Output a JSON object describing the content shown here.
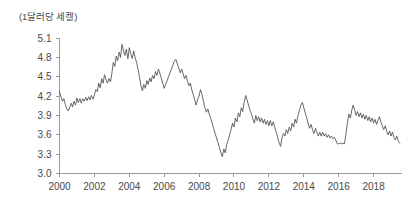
{
  "figure": {
    "unit_label": "(1달러당 세켈)",
    "background_color": "#ffffff",
    "line_color": "#4d4d4d",
    "axis_color": "#9a9a9a",
    "text_color": "#4a4a4a"
  },
  "chart_data": {
    "type": "line",
    "title": "",
    "subtitle": "",
    "xlabel": "",
    "ylabel": "(1달러당 세켈)",
    "unit": "1달러당 세켈",
    "grid": false,
    "legend": "none",
    "xlim": [
      2000.0,
      2019.6
    ],
    "ylim": [
      3.0,
      5.1
    ],
    "xticks": [
      2000,
      2002,
      2004,
      2006,
      2008,
      2010,
      2012,
      2014,
      2016,
      2018
    ],
    "xtick_labels": [
      "2000",
      "2002",
      "2004",
      "2006",
      "2008",
      "2010",
      "2012",
      "2014",
      "2016",
      "2018"
    ],
    "yticks": [
      3.0,
      3.3,
      3.6,
      3.9,
      4.2,
      4.5,
      4.8,
      5.1
    ],
    "ytick_labels": [
      "3.0",
      "3.3",
      "3.6",
      "3.9",
      "4.2",
      "4.5",
      "4.8",
      "5.1"
    ],
    "series": [
      {
        "name": "USD/ILS",
        "x": [
          2000.0,
          2000.08,
          2000.17,
          2000.25,
          2000.33,
          2000.42,
          2000.5,
          2000.58,
          2000.67,
          2000.75,
          2000.83,
          2000.92,
          2001.0,
          2001.08,
          2001.17,
          2001.25,
          2001.33,
          2001.42,
          2001.5,
          2001.58,
          2001.67,
          2001.75,
          2001.83,
          2001.92,
          2002.0,
          2002.08,
          2002.17,
          2002.25,
          2002.33,
          2002.42,
          2002.5,
          2002.58,
          2002.67,
          2002.75,
          2002.83,
          2002.92,
          2003.0,
          2003.08,
          2003.17,
          2003.25,
          2003.33,
          2003.42,
          2003.5,
          2003.58,
          2003.67,
          2003.75,
          2003.83,
          2003.92,
          2004.0,
          2004.08,
          2004.17,
          2004.25,
          2004.33,
          2004.42,
          2004.5,
          2004.58,
          2004.67,
          2004.75,
          2004.83,
          2004.92,
          2005.0,
          2005.08,
          2005.17,
          2005.25,
          2005.33,
          2005.42,
          2005.5,
          2005.58,
          2005.67,
          2005.75,
          2005.83,
          2005.92,
          2006.0,
          2006.08,
          2006.17,
          2006.25,
          2006.33,
          2006.42,
          2006.5,
          2006.58,
          2006.67,
          2006.75,
          2006.83,
          2006.92,
          2007.0,
          2007.08,
          2007.17,
          2007.25,
          2007.33,
          2007.42,
          2007.5,
          2007.58,
          2007.67,
          2007.75,
          2007.83,
          2007.92,
          2008.0,
          2008.08,
          2008.17,
          2008.25,
          2008.33,
          2008.42,
          2008.5,
          2008.58,
          2008.67,
          2008.75,
          2008.83,
          2008.92,
          2009.0,
          2009.08,
          2009.17,
          2009.25,
          2009.33,
          2009.42,
          2009.5,
          2009.58,
          2009.67,
          2009.75,
          2009.83,
          2009.92,
          2010.0,
          2010.08,
          2010.17,
          2010.25,
          2010.33,
          2010.42,
          2010.5,
          2010.58,
          2010.67,
          2010.75,
          2010.83,
          2010.92,
          2011.0,
          2011.08,
          2011.17,
          2011.25,
          2011.33,
          2011.42,
          2011.5,
          2011.58,
          2011.67,
          2011.75,
          2011.83,
          2011.92,
          2012.0,
          2012.08,
          2012.17,
          2012.25,
          2012.33,
          2012.42,
          2012.5,
          2012.58,
          2012.67,
          2012.75,
          2012.83,
          2012.92,
          2013.0,
          2013.08,
          2013.17,
          2013.25,
          2013.33,
          2013.42,
          2013.5,
          2013.58,
          2013.67,
          2013.75,
          2013.83,
          2013.92,
          2014.0,
          2014.08,
          2014.17,
          2014.25,
          2014.33,
          2014.42,
          2014.5,
          2014.58,
          2014.67,
          2014.75,
          2014.83,
          2014.92,
          2015.0,
          2015.08,
          2015.17,
          2015.25,
          2015.33,
          2015.42,
          2015.5,
          2015.58,
          2015.67,
          2015.75,
          2015.83,
          2015.92,
          2016.0,
          2016.08,
          2016.17,
          2016.25,
          2016.33,
          2016.42,
          2016.5,
          2016.58,
          2016.67,
          2016.75,
          2016.83,
          2016.92,
          2017.0,
          2017.08,
          2017.17,
          2017.25,
          2017.33,
          2017.42,
          2017.5,
          2017.58,
          2017.67,
          2017.75,
          2017.83,
          2017.92,
          2018.0,
          2018.08,
          2018.17,
          2018.25,
          2018.33,
          2018.42,
          2018.5,
          2018.58,
          2018.67,
          2018.75,
          2018.83,
          2018.92,
          2019.0,
          2019.08,
          2019.17,
          2019.25,
          2019.33,
          2019.42,
          2019.5
        ],
        "values": [
          4.27,
          4.2,
          4.12,
          4.16,
          4.07,
          4.0,
          3.97,
          4.02,
          4.09,
          4.03,
          4.12,
          4.06,
          4.17,
          4.1,
          4.16,
          4.09,
          4.16,
          4.12,
          4.18,
          4.13,
          4.19,
          4.14,
          4.21,
          4.15,
          4.22,
          4.3,
          4.27,
          4.4,
          4.33,
          4.47,
          4.4,
          4.53,
          4.45,
          4.4,
          4.47,
          4.42,
          4.55,
          4.72,
          4.66,
          4.82,
          4.75,
          4.88,
          4.8,
          5.0,
          4.9,
          4.83,
          4.93,
          4.78,
          4.95,
          4.86,
          4.78,
          4.9,
          4.8,
          4.72,
          4.62,
          4.5,
          4.36,
          4.28,
          4.38,
          4.32,
          4.44,
          4.38,
          4.48,
          4.42,
          4.52,
          4.47,
          4.58,
          4.52,
          4.62,
          4.55,
          4.48,
          4.4,
          4.32,
          4.38,
          4.44,
          4.5,
          4.56,
          4.62,
          4.68,
          4.74,
          4.77,
          4.7,
          4.64,
          4.56,
          4.62,
          4.55,
          4.47,
          4.52,
          4.44,
          4.36,
          4.4,
          4.3,
          4.22,
          4.14,
          4.06,
          4.15,
          4.2,
          4.3,
          4.22,
          4.12,
          4.02,
          3.95,
          4.0,
          3.92,
          3.85,
          3.78,
          3.7,
          3.62,
          3.55,
          3.48,
          3.4,
          3.32,
          3.26,
          3.38,
          3.32,
          3.45,
          3.52,
          3.6,
          3.68,
          3.78,
          3.72,
          3.86,
          3.8,
          3.94,
          3.88,
          4.02,
          3.96,
          4.1,
          4.21,
          4.14,
          4.06,
          3.98,
          3.92,
          3.85,
          3.78,
          3.9,
          3.82,
          3.88,
          3.8,
          3.86,
          3.78,
          3.84,
          3.76,
          3.82,
          3.74,
          3.82,
          3.74,
          3.8,
          3.72,
          3.64,
          3.56,
          3.48,
          3.42,
          3.55,
          3.62,
          3.58,
          3.68,
          3.62,
          3.72,
          3.66,
          3.78,
          3.72,
          3.84,
          3.78,
          3.9,
          3.98,
          4.06,
          4.1,
          4.02,
          3.94,
          3.86,
          3.78,
          3.7,
          3.76,
          3.68,
          3.62,
          3.7,
          3.64,
          3.58,
          3.64,
          3.58,
          3.64,
          3.58,
          3.62,
          3.56,
          3.6,
          3.55,
          3.58,
          3.54,
          3.56,
          3.52,
          3.46,
          3.46,
          3.47,
          3.46,
          3.47,
          3.46,
          3.62,
          3.78,
          3.92,
          3.86,
          3.98,
          4.06,
          3.98,
          3.9,
          3.96,
          3.88,
          3.94,
          3.86,
          3.92,
          3.84,
          3.9,
          3.82,
          3.88,
          3.8,
          3.86,
          3.78,
          3.84,
          3.76,
          3.82,
          3.88,
          3.8,
          3.74,
          3.68,
          3.74,
          3.66,
          3.6,
          3.66,
          3.58,
          3.64,
          3.56,
          3.52,
          3.58,
          3.5,
          3.47
        ]
      }
    ],
    "annotations": [],
    "summary": {
      "start_value": 4.27,
      "end_value": 3.47,
      "max_value": 5.0,
      "max_at": 2003.58,
      "min_value": 3.26,
      "min_at": 2009.33
    }
  }
}
